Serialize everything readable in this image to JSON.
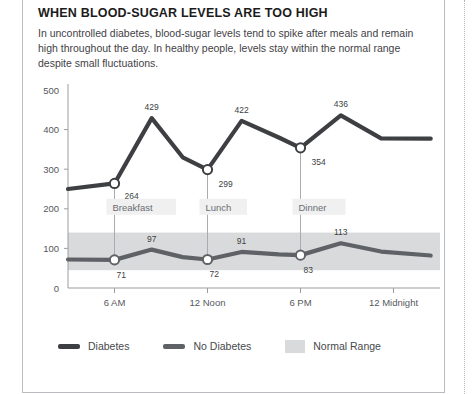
{
  "card": {
    "title": "WHEN BLOOD-SUGAR LEVELS ARE TOO HIGH",
    "description": "In uncontrolled diabetes, blood-sugar levels tend to spike after meals and remain high throughout the day. In healthy people, levels stay within the normal range despite small fluctuations."
  },
  "colors": {
    "diabetes_line": "#3d3f42",
    "no_diabetes_line": "#5e6266",
    "normal_range_band": "#d9dadb",
    "axis": "#9a9da1",
    "text": "#3f4246",
    "muted_text": "#6a6e73",
    "card_border": "#b9bcc0",
    "marker_fill": "#ffffff"
  },
  "chart_data": {
    "type": "line",
    "title": "WHEN BLOOD-SUGAR LEVELS ARE TOO HIGH",
    "xlabel": "",
    "ylabel": "",
    "ylim": [
      0,
      500
    ],
    "yticks": [
      0,
      100,
      200,
      300,
      400,
      500
    ],
    "ytick_labels": [
      "0",
      "100",
      "200",
      "300",
      "400",
      "500"
    ],
    "xticks": [
      6,
      12,
      18,
      24
    ],
    "xtick_labels": [
      "6 AM",
      "12 Noon",
      "6 PM",
      "12 Midnight"
    ],
    "xlim": [
      3,
      27
    ],
    "grid": false,
    "legend_position": "bottom",
    "bands": [
      {
        "name": "Normal Range",
        "y0": 45,
        "y1": 140,
        "color": "#d9dadb"
      }
    ],
    "series": [
      {
        "name": "Diabetes",
        "color": "#3d3f42",
        "x": [
          3,
          6,
          8.4,
          10.4,
          12,
          14.2,
          16.6,
          18,
          20.6,
          23.2,
          26.4
        ],
        "values": [
          250,
          264,
          429,
          330,
          299,
          422,
          380,
          354,
          436,
          378,
          377
        ]
      },
      {
        "name": "No Diabetes",
        "color": "#5e6266",
        "x": [
          3,
          6,
          8.4,
          10.4,
          12,
          14.2,
          16.6,
          18,
          20.6,
          23.2,
          26.4
        ],
        "values": [
          72,
          71,
          97,
          78,
          72,
          91,
          85,
          83,
          113,
          92,
          82
        ]
      }
    ],
    "annotations": [
      {
        "label": "264",
        "series": "Diabetes",
        "x": 6,
        "value": 264,
        "dx": 10,
        "dy": 16
      },
      {
        "label": "429",
        "series": "Diabetes",
        "x": 8.4,
        "value": 429,
        "dx": 0,
        "dy": -8
      },
      {
        "label": "299",
        "series": "Diabetes",
        "x": 12,
        "value": 299,
        "dx": 11,
        "dy": 17
      },
      {
        "label": "422",
        "series": "Diabetes",
        "x": 14.2,
        "value": 422,
        "dx": 0,
        "dy": -8
      },
      {
        "label": "354",
        "series": "Diabetes",
        "x": 18,
        "value": 354,
        "dx": 11,
        "dy": 17
      },
      {
        "label": "436",
        "series": "Diabetes",
        "x": 20.6,
        "value": 436,
        "dx": 0,
        "dy": -8
      },
      {
        "label": "71",
        "series": "No Diabetes",
        "x": 6,
        "value": 71,
        "dx": 2,
        "dy": 18
      },
      {
        "label": "97",
        "series": "No Diabetes",
        "x": 8.4,
        "value": 97,
        "dx": 0,
        "dy": -8
      },
      {
        "label": "72",
        "series": "No Diabetes",
        "x": 12,
        "value": 72,
        "dx": 2,
        "dy": 18
      },
      {
        "label": "91",
        "series": "No Diabetes",
        "x": 14.2,
        "value": 91,
        "dx": 0,
        "dy": -8
      },
      {
        "label": "83",
        "series": "No Diabetes",
        "x": 18,
        "value": 83,
        "dx": 3,
        "dy": 18
      },
      {
        "label": "113",
        "series": "No Diabetes",
        "x": 20.6,
        "value": 113,
        "dx": 0,
        "dy": -8
      }
    ],
    "markers": [
      {
        "label": "Breakfast",
        "x": 6,
        "diabetes_value": 264,
        "no_diabetes_value": 71
      },
      {
        "label": "Lunch",
        "x": 12,
        "diabetes_value": 299,
        "no_diabetes_value": 72
      },
      {
        "label": "Dinner",
        "x": 18,
        "diabetes_value": 354,
        "no_diabetes_value": 83
      }
    ],
    "legend": [
      {
        "label": "Diabetes",
        "type": "line",
        "color": "#3d3f42"
      },
      {
        "label": "No Diabetes",
        "type": "line",
        "color": "#5e6266"
      },
      {
        "label": "Normal Range",
        "type": "box",
        "color": "#d9dadb"
      }
    ]
  }
}
